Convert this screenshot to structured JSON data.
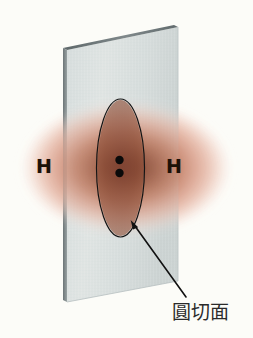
{
  "figure": {
    "background_color": "#fcfcf8"
  },
  "atoms": [
    {
      "id": "left",
      "label": "H",
      "x": 36,
      "y": 157
    },
    {
      "id": "right",
      "label": "H",
      "x": 166,
      "y": 157
    }
  ],
  "electron_cloud": {
    "name": "electron-density-cloud",
    "center_x": 126,
    "center_y": 168,
    "radius_x": 106,
    "radius_y": 68,
    "core_color": "#7d4130",
    "mid_color": "#c07d67",
    "outer_color": "#e8b4a4",
    "edge_color": "#f6ddd4"
  },
  "plate": {
    "name": "cutting-plane-slab",
    "face_color": "#d6dcdc",
    "face_color_2": "#c3cbcb",
    "edge_color": "#6f7879",
    "edge_color_light": "#9aa3a4",
    "top_left": [
      63,
      48
    ],
    "top_right": [
      178,
      27
    ],
    "bottom_right": [
      178,
      281
    ],
    "bottom_left": [
      63,
      302
    ],
    "thickness": 5
  },
  "cross_section": {
    "name": "circular-cross-section-ellipse",
    "center_x": 120.5,
    "center_y": 168,
    "radius_x": 24,
    "radius_y": 69,
    "stroke_color": "#141414",
    "stroke_width": 1.2,
    "fill_color": "#8a4a36"
  },
  "electron_pair": {
    "name": "shared-electron-pair",
    "color": "#0a0a0a",
    "dots": [
      {
        "cx": 119.5,
        "cy": 160,
        "r": 4.2
      },
      {
        "cx": 119.5,
        "cy": 173,
        "r": 4.2
      }
    ]
  },
  "pointer": {
    "name": "caption-leader-arrow",
    "color": "#111111",
    "from_x": 186,
    "from_y": 297,
    "to_x": 131.5,
    "to_y": 221,
    "stroke_width": 1.6
  },
  "caption": {
    "name": "cross-section-caption",
    "text": "圓切面",
    "x": 172,
    "y": 303,
    "color": "#2a2a2a"
  }
}
